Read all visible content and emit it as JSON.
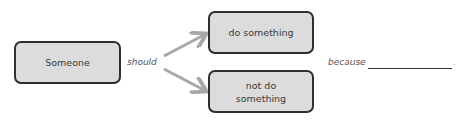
{
  "diagram": {
    "subject_box": "Someone",
    "connector_label": "should",
    "option_top": "do something",
    "option_bottom": "not do something",
    "reason_label": "because",
    "reason_blank": "",
    "end_punctuation": "."
  },
  "colors": {
    "box_fill": "#dcdcdc",
    "box_border": "#2e2e2e",
    "arrow": "#a8a8a8"
  }
}
